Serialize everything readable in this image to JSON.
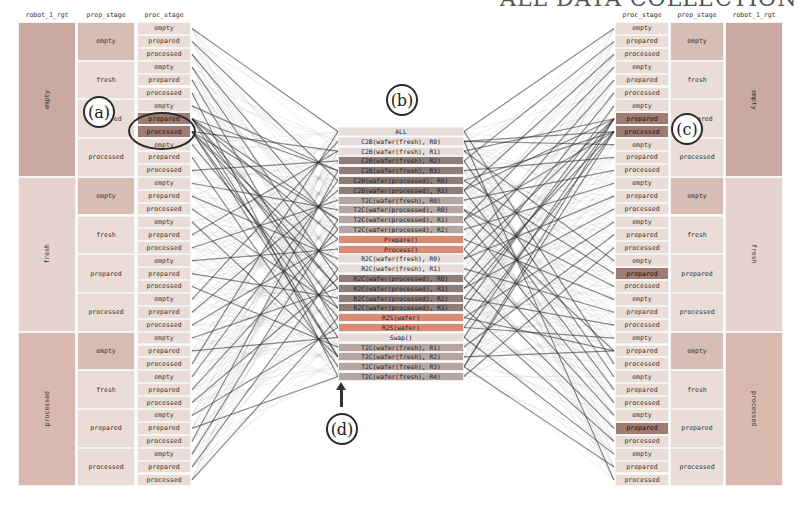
{
  "page_heading": "ALL DATA COLLECTION",
  "left_panel": {
    "headers": [
      "robot_1_rgt",
      "prep_stage",
      "proc_stage"
    ],
    "groups": [
      {
        "robot": "empty",
        "prep": [
          "empty",
          "fresh",
          "prepared",
          "processed"
        ]
      },
      {
        "robot": "fresh",
        "prep": [
          "empty",
          "fresh",
          "prepared",
          "processed"
        ]
      },
      {
        "robot": "processed",
        "prep": [
          "empty",
          "fresh",
          "prepared",
          "processed"
        ]
      }
    ],
    "proc_values": [
      "empty",
      "prepared",
      "processed"
    ]
  },
  "right_panel": {
    "headers": [
      "proc_stage",
      "prep_stage",
      "robot_1_rgt"
    ],
    "groups": [
      {
        "robot": "empty",
        "prep": [
          "empty",
          "fresh",
          "prepared",
          "processed"
        ]
      },
      {
        "robot": "fresh",
        "prep": [
          "empty",
          "fresh",
          "prepared",
          "processed"
        ]
      },
      {
        "robot": "processed",
        "prep": [
          "empty",
          "fresh",
          "prepared",
          "processed"
        ]
      }
    ],
    "proc_values": [
      "empty",
      "prepared",
      "processed"
    ]
  },
  "actions": [
    {
      "label": "ALL",
      "tone": "light"
    },
    {
      "label": "C2B(wafer(fresh), R0)",
      "tone": "light"
    },
    {
      "label": "C2B(wafer(fresh), R1)",
      "tone": "light"
    },
    {
      "label": "C2B(wafer(fresh), R2)",
      "tone": "dark"
    },
    {
      "label": "C2B(wafer(fresh), R3)",
      "tone": "dark"
    },
    {
      "label": "C2B(wafer(processed), R0)",
      "tone": "dark"
    },
    {
      "label": "C2B(wafer(processed), R1)",
      "tone": "dark"
    },
    {
      "label": "T2C(wafer(fresh), R0)",
      "tone": "mid"
    },
    {
      "label": "T2C(wafer(processed), R0)",
      "tone": "mid"
    },
    {
      "label": "T2C(wafer(processed), R1)",
      "tone": "mid"
    },
    {
      "label": "T2C(wafer(processed), R2)",
      "tone": "mid"
    },
    {
      "label": "Prepare()",
      "tone": "accent"
    },
    {
      "label": "Process()",
      "tone": "accent"
    },
    {
      "label": "R2C(wafer(fresh), R0)",
      "tone": "light"
    },
    {
      "label": "R2C(wafer(fresh), R1)",
      "tone": "light"
    },
    {
      "label": "R2C(wafer(processed), R0)",
      "tone": "dark"
    },
    {
      "label": "R2C(wafer(processed), R1)",
      "tone": "dark"
    },
    {
      "label": "R2C(wafer(processed), R2)",
      "tone": "dark"
    },
    {
      "label": "R2C(wafer(processed), R3)",
      "tone": "dark"
    },
    {
      "label": "R2S(wafer)",
      "tone": "accent"
    },
    {
      "label": "R2S(wafer)",
      "tone": "accent"
    },
    {
      "label": "Swap()",
      "tone": "light"
    },
    {
      "label": "T2C(wafer(fresh), R1)",
      "tone": "mid"
    },
    {
      "label": "T2C(wafer(fresh), R2)",
      "tone": "mid"
    },
    {
      "label": "T2C(wafer(fresh), R3)",
      "tone": "mid"
    },
    {
      "label": "T2C(wafer(fresh), R4)",
      "tone": "mid"
    }
  ],
  "callouts": {
    "a": "(a)",
    "b": "(b)",
    "c": "(c)",
    "d": "(d)"
  },
  "colors": {
    "robot_empty": "#c9a9a0",
    "robot_fresh": "#e6d3cd",
    "robot_processed": "#d9b9ae",
    "prep_empty": "#d7bdb4",
    "prep_other": "#eadcd7",
    "proc_light": "#eaddd8",
    "proc_dark": "#9e7c73",
    "line": "#2c2c2c",
    "center_light": "#e6dcd9",
    "center_mid": "#b6a6a1",
    "center_dark": "#8f7d78",
    "center_accent": "#d98b73"
  }
}
